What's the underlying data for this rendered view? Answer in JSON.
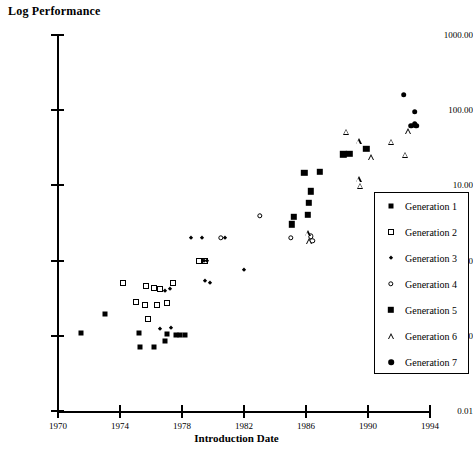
{
  "chart_data": {
    "type": "scatter",
    "title": "Log Performance",
    "xlabel": "Introduction Date",
    "ylabel": "Log Performance",
    "yscale": "log",
    "xlim": [
      1970,
      1994
    ],
    "ylim": [
      0.01,
      1000.0
    ],
    "xticks": [
      1970,
      1974,
      1978,
      1982,
      1986,
      1990,
      1994
    ],
    "xticklabels": [
      "1970",
      "1974",
      "1978",
      "1982",
      "1986",
      "1990",
      "1994"
    ],
    "yticks": [
      0.01,
      0.1,
      1.0,
      10.0,
      100.0,
      1000.0
    ],
    "yticklabels": [
      "0.01",
      "0.10",
      "1.00",
      "10.00",
      "100.00",
      "1000.00"
    ],
    "grid": false,
    "legend_position": "right-lower",
    "series": [
      {
        "name": "Generation 1",
        "marker": "filled-square-small",
        "points": [
          [
            1971.5,
            0.108
          ],
          [
            1973.0,
            0.195
          ],
          [
            1975.2,
            0.108
          ],
          [
            1975.3,
            0.072
          ],
          [
            1976.2,
            0.071
          ],
          [
            1976.9,
            0.086
          ],
          [
            1977.0,
            0.105
          ],
          [
            1977.6,
            0.104
          ],
          [
            1977.9,
            0.104
          ],
          [
            1978.2,
            0.104
          ]
        ]
      },
      {
        "name": "Generation 2",
        "marker": "open-square",
        "points": [
          [
            1974.2,
            0.5
          ],
          [
            1975.0,
            0.285
          ],
          [
            1975.6,
            0.255
          ],
          [
            1975.7,
            0.46
          ],
          [
            1975.8,
            0.165
          ],
          [
            1976.2,
            0.43
          ],
          [
            1976.4,
            0.255
          ],
          [
            1976.6,
            0.42
          ],
          [
            1977.0,
            0.275
          ],
          [
            1977.4,
            0.5
          ],
          [
            1979.1,
            1.0
          ],
          [
            1979.5,
            0.995
          ]
        ]
      },
      {
        "name": "Generation 3",
        "marker": "filled-diamond-small",
        "points": [
          [
            1976.6,
            0.122
          ],
          [
            1977.3,
            0.128
          ],
          [
            1976.9,
            0.4
          ],
          [
            1977.2,
            0.425
          ],
          [
            1978.6,
            2.0
          ],
          [
            1979.3,
            2.0
          ],
          [
            1979.4,
            0.99
          ],
          [
            1979.6,
            0.99
          ],
          [
            1979.5,
            0.54
          ],
          [
            1979.8,
            0.5
          ],
          [
            1980.8,
            2.0
          ],
          [
            1982.0,
            0.76
          ],
          [
            1983.0,
            3.95
          ]
        ]
      },
      {
        "name": "Generation 4",
        "marker": "open-circle",
        "points": [
          [
            1980.5,
            2.0
          ],
          [
            1983.0,
            3.95
          ],
          [
            1985.0,
            2.0
          ],
          [
            1986.3,
            2.1
          ],
          [
            1986.4,
            1.82
          ]
        ]
      },
      {
        "name": "Generation 5",
        "marker": "filled-square-large",
        "points": [
          [
            1985.1,
            3.05
          ],
          [
            1985.2,
            3.85
          ],
          [
            1985.9,
            14.8
          ],
          [
            1986.1,
            4.05
          ],
          [
            1986.2,
            5.85
          ],
          [
            1986.3,
            8.3
          ],
          [
            1986.9,
            15.2
          ],
          [
            1988.4,
            26.0
          ],
          [
            1988.8,
            26.5
          ],
          [
            1989.9,
            30.5
          ]
        ]
      },
      {
        "name": "Generation 6",
        "marker": "open-triangle",
        "points": [
          [
            1986.1,
            2.3
          ],
          [
            1986.2,
            1.8
          ],
          [
            1988.6,
            52.0
          ],
          [
            1989.4,
            38.5
          ],
          [
            1990.2,
            23.5
          ],
          [
            1989.4,
            12.0
          ],
          [
            1989.5,
            9.9
          ],
          [
            1991.5,
            38.0
          ],
          [
            1992.6,
            53.0
          ],
          [
            1992.4,
            25.5
          ]
        ]
      },
      {
        "name": "Generation 7",
        "marker": "filled-circle",
        "points": [
          [
            1992.3,
            160.0
          ],
          [
            1993.0,
            95.0
          ],
          [
            1993.0,
            66.0
          ],
          [
            1992.8,
            62.0
          ],
          [
            1993.1,
            62.0
          ]
        ]
      }
    ]
  },
  "legend": {
    "entries": [
      {
        "label": "Generation 1",
        "marker": "filled-square-small"
      },
      {
        "label": "Generation 2",
        "marker": "open-square"
      },
      {
        "label": "Generation 3",
        "marker": "filled-diamond-small"
      },
      {
        "label": "Generation 4",
        "marker": "open-circle"
      },
      {
        "label": "Generation 5",
        "marker": "filled-square-large"
      },
      {
        "label": "Generation 6",
        "marker": "open-triangle"
      },
      {
        "label": "Generation 7",
        "marker": "filled-circle"
      }
    ]
  },
  "colors": {
    "ink": "#000000",
    "background": "#ffffff"
  }
}
